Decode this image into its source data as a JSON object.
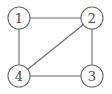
{
  "figure": {
    "kind": "undirected-graph-diagram",
    "width": 112,
    "height": 94,
    "background_color": "#fefefe",
    "line_color": "#6b6b6b",
    "label_color": "#4d4d4d"
  },
  "graph": {
    "node_radius": 11,
    "nodes": [
      {
        "id": "1",
        "label": "1",
        "x": 19,
        "y": 18,
        "position": "top-left"
      },
      {
        "id": "2",
        "label": "2",
        "x": 92,
        "y": 18,
        "position": "top-right"
      },
      {
        "id": "3",
        "label": "3",
        "x": 92,
        "y": 76,
        "position": "bottom-right"
      },
      {
        "id": "4",
        "label": "4",
        "x": 19,
        "y": 76,
        "position": "bottom-left"
      }
    ],
    "edges": [
      {
        "from": "1",
        "to": "2",
        "x1": 30,
        "y1": 18,
        "x2": 81,
        "y2": 18
      },
      {
        "from": "1",
        "to": "4",
        "x1": 19,
        "y1": 29,
        "x2": 19,
        "y2": 65
      },
      {
        "from": "2",
        "to": "3",
        "x1": 92,
        "y1": 29,
        "x2": 92,
        "y2": 65
      },
      {
        "from": "4",
        "to": "3",
        "x1": 30,
        "y1": 76,
        "x2": 81,
        "y2": 76
      },
      {
        "from": "4",
        "to": "2",
        "x1": 27.8,
        "y1": 69.3,
        "x2": 83.2,
        "y2": 24.7
      }
    ]
  }
}
